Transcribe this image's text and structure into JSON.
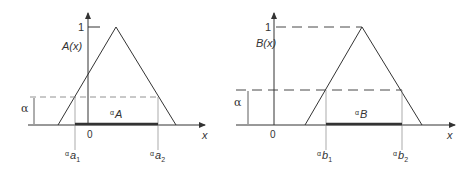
{
  "left": {
    "function_label": "A(x)",
    "one_label": "1",
    "alpha_label": "α",
    "zero_label": "0",
    "x_label": "x",
    "cut_label": {
      "pre": "α",
      "main": "A"
    },
    "left_endpoint": {
      "pre": "α",
      "main": "a",
      "sub": "1"
    },
    "right_endpoint": {
      "pre": "α",
      "main": "a",
      "sub": "2"
    }
  },
  "right": {
    "function_label": "B(x)",
    "one_label": "1",
    "alpha_label": "α",
    "zero_label": "0",
    "x_label": "x",
    "cut_label": {
      "pre": "α",
      "main": "B"
    },
    "left_endpoint": {
      "pre": "α",
      "main": "b",
      "sub": "1"
    },
    "right_endpoint": {
      "pre": "α",
      "main": "b",
      "sub": "2"
    }
  },
  "colors": {
    "line": "#333333",
    "dash": "#555555"
  }
}
